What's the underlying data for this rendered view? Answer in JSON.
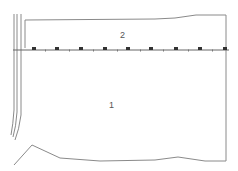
{
  "diagram": {
    "type": "plan-drawing",
    "colors": {
      "line": "#8a8a8a",
      "marker": "#333333",
      "label": "#555555",
      "background": "#ffffff"
    },
    "regions": [
      {
        "id": "region-2",
        "label": "2",
        "x": 120,
        "y": 31
      },
      {
        "id": "region-1",
        "label": "1",
        "x": 109,
        "y": 101
      }
    ],
    "boundary": {
      "top": [
        [
          25,
          48
        ],
        [
          25,
          20
        ],
        [
          155,
          19
        ],
        [
          175,
          18
        ],
        [
          196,
          15
        ],
        [
          226,
          15
        ]
      ],
      "right": [
        [
          226,
          15
        ],
        [
          226,
          161
        ]
      ],
      "bottom": [
        [
          14,
          165
        ],
        [
          32,
          145
        ],
        [
          60,
          158
        ],
        [
          100,
          161
        ],
        [
          155,
          160
        ],
        [
          178,
          157
        ],
        [
          205,
          161
        ],
        [
          226,
          161
        ]
      ]
    },
    "divider_line": {
      "y": 50,
      "x_start": 13,
      "x_end": 229,
      "markers": [
        34,
        57,
        81,
        105,
        128,
        151,
        176,
        200,
        225
      ],
      "ticks": [
        45,
        69,
        93,
        117,
        140,
        163,
        188,
        212
      ]
    },
    "left_curves": [
      {
        "x": 14,
        "curve": [
          [
            14,
            14
          ],
          [
            14,
            110
          ],
          [
            13,
            125
          ],
          [
            11,
            135
          ]
        ]
      },
      {
        "x": 17,
        "curve": [
          [
            17,
            14
          ],
          [
            17,
            112
          ],
          [
            16,
            127
          ],
          [
            13,
            137
          ]
        ]
      },
      {
        "x": 21,
        "curve": [
          [
            21,
            14
          ],
          [
            21,
            115
          ],
          [
            19,
            130
          ],
          [
            15,
            140
          ]
        ]
      }
    ]
  }
}
